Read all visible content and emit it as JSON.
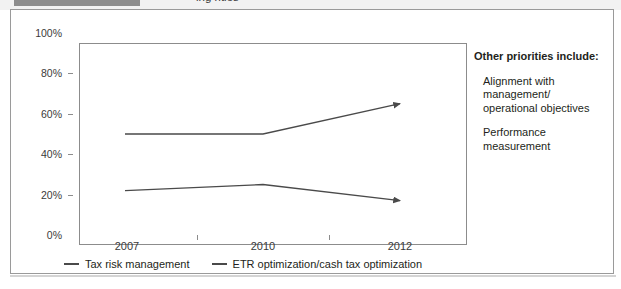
{
  "page": {
    "title_fragment": "ing                 rities",
    "card_border_color": "#9a9a9a"
  },
  "chart_data": {
    "type": "line",
    "title": "",
    "xlabel": "",
    "ylabel": "",
    "categories": [
      "2007",
      "2010",
      "2012"
    ],
    "ylim": [
      0,
      100
    ],
    "y_ticks": [
      "0%",
      "20%",
      "40%",
      "60%",
      "80%",
      "100%"
    ],
    "y_tick_values": [
      0,
      20,
      40,
      60,
      80,
      100
    ],
    "grid": false,
    "legend_position": "bottom",
    "line_color": "#4a4a4a",
    "series": [
      {
        "name": "Tax risk management",
        "values": [
          50,
          50,
          65
        ]
      },
      {
        "name": "ETR optimization/cash tax optimization",
        "values": [
          22,
          25,
          17
        ]
      }
    ]
  },
  "notes": {
    "heading": "Other priorities include:",
    "items": [
      "Alignment with\nmanagement/\noperational objectives",
      "Performance\nmeasurement"
    ]
  }
}
